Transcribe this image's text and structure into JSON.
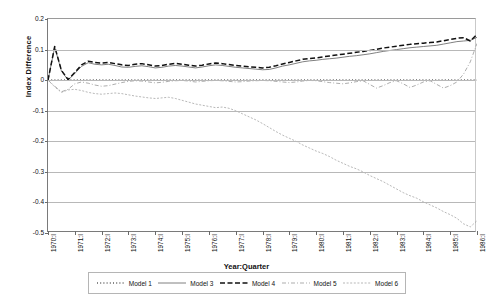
{
  "chart_data": {
    "type": "line",
    "title": "",
    "xlabel": "Year:Quarter",
    "ylabel": "Index Difference",
    "ylim": [
      -0.5,
      0.2
    ],
    "yticks": [
      0.2,
      0.1,
      0,
      -0.1,
      -0.2,
      -0.3,
      -0.4,
      -0.5
    ],
    "ytick_labels": [
      "0.2",
      "0.1",
      "0",
      "-0.1",
      "-0.2",
      "-0.3",
      "-0.4",
      "-0.5"
    ],
    "grid": true,
    "legend_position": "bottom",
    "categories": [
      "1970:I",
      "1970:II",
      "1970:III",
      "1970:IV",
      "1971:I",
      "1971:II",
      "1971:III",
      "1971:IV",
      "1972:I",
      "1972:II",
      "1972:III",
      "1972:IV",
      "1973:I",
      "1973:II",
      "1973:III",
      "1973:IV",
      "1974:I",
      "1974:II",
      "1974:III",
      "1974:IV",
      "1975:I",
      "1975:II",
      "1975:III",
      "1975:IV",
      "1976:I",
      "1976:II",
      "1976:III",
      "1976:IV",
      "1977:I",
      "1977:II",
      "1977:III",
      "1977:IV",
      "1978:I",
      "1978:II",
      "1978:III",
      "1978:IV",
      "1979:I",
      "1979:II",
      "1979:III",
      "1979:IV",
      "1980:I",
      "1980:II",
      "1980:III",
      "1980:IV",
      "1981:I",
      "1981:II",
      "1981:III",
      "1981:IV",
      "1982:I",
      "1982:II",
      "1982:III",
      "1982:IV",
      "1983:I",
      "1983:II",
      "1983:III",
      "1983:IV",
      "1984:I",
      "1984:II",
      "1984:III",
      "1984:IV",
      "1985:I",
      "1985:II",
      "1985:III",
      "1985:IV",
      "1986:I"
    ],
    "xtick_labels": [
      "1970:I",
      "1971:I",
      "1972:I",
      "1973:I",
      "1974:I",
      "1975:I",
      "1976:I",
      "1977:I",
      "1978:I",
      "1979:I",
      "1980:I",
      "1981:I",
      "1982:I",
      "1983:I",
      "1984:I",
      "1985:I",
      "1986:I"
    ],
    "series": [
      {
        "name": "Model 1",
        "style": "dotted",
        "color": "#111111",
        "values": [
          0.0,
          0.0,
          0.0,
          0.0,
          0.0,
          0.0,
          0.0,
          0.0,
          0.0,
          0.0,
          0.0,
          0.0,
          0.0,
          0.0,
          0.0,
          0.0,
          0.0,
          0.0,
          0.0,
          0.0,
          0.0,
          0.0,
          0.0,
          0.0,
          0.0,
          0.0,
          0.0,
          0.0,
          0.0,
          0.0,
          0.0,
          0.0,
          0.0,
          0.0,
          0.0,
          0.0,
          0.0,
          0.0,
          0.0,
          0.0,
          0.0,
          0.0,
          0.0,
          0.0,
          0.0,
          0.0,
          0.0,
          0.0,
          0.0,
          0.0,
          0.0,
          0.0,
          0.0,
          0.0,
          0.0,
          0.0,
          0.0,
          0.0,
          0.0,
          0.0,
          0.0,
          0.0,
          0.0,
          0.0,
          0.0
        ]
      },
      {
        "name": "Model 3",
        "style": "solid",
        "color": "#5f5f5f",
        "values": [
          0.0,
          0.108,
          0.03,
          0.0,
          0.022,
          0.045,
          0.057,
          0.052,
          0.05,
          0.052,
          0.048,
          0.043,
          0.042,
          0.045,
          0.047,
          0.044,
          0.04,
          0.042,
          0.046,
          0.048,
          0.046,
          0.043,
          0.04,
          0.043,
          0.047,
          0.05,
          0.048,
          0.045,
          0.042,
          0.04,
          0.038,
          0.036,
          0.034,
          0.035,
          0.04,
          0.046,
          0.05,
          0.055,
          0.06,
          0.063,
          0.065,
          0.068,
          0.07,
          0.072,
          0.075,
          0.078,
          0.08,
          0.083,
          0.086,
          0.09,
          0.094,
          0.097,
          0.1,
          0.103,
          0.106,
          0.108,
          0.11,
          0.112,
          0.114,
          0.118,
          0.122,
          0.126,
          0.128,
          0.13,
          0.14
        ]
      },
      {
        "name": "Model 4",
        "style": "dashed-bold",
        "color": "#111111",
        "values": [
          0.0,
          0.11,
          0.032,
          0.002,
          0.025,
          0.05,
          0.062,
          0.058,
          0.056,
          0.058,
          0.054,
          0.05,
          0.048,
          0.052,
          0.054,
          0.05,
          0.046,
          0.048,
          0.052,
          0.055,
          0.052,
          0.049,
          0.046,
          0.049,
          0.053,
          0.056,
          0.054,
          0.051,
          0.048,
          0.046,
          0.044,
          0.042,
          0.04,
          0.042,
          0.047,
          0.053,
          0.058,
          0.063,
          0.068,
          0.071,
          0.073,
          0.076,
          0.079,
          0.082,
          0.085,
          0.088,
          0.091,
          0.094,
          0.097,
          0.101,
          0.105,
          0.108,
          0.111,
          0.114,
          0.117,
          0.119,
          0.121,
          0.123,
          0.125,
          0.129,
          0.133,
          0.137,
          0.139,
          0.128,
          0.15
        ]
      },
      {
        "name": "Model 5",
        "style": "dash-dot",
        "color": "#8a8a8a",
        "values": [
          0.0,
          -0.02,
          -0.038,
          -0.03,
          -0.012,
          -0.006,
          -0.01,
          -0.016,
          -0.02,
          -0.018,
          -0.013,
          -0.008,
          -0.004,
          -0.002,
          -0.003,
          -0.006,
          -0.009,
          -0.007,
          -0.004,
          -0.002,
          -0.001,
          -0.003,
          -0.006,
          -0.004,
          -0.002,
          -0.001,
          -0.002,
          -0.004,
          -0.006,
          -0.005,
          -0.003,
          -0.002,
          -0.001,
          -0.002,
          -0.004,
          -0.006,
          -0.008,
          -0.006,
          -0.003,
          -0.001,
          -0.002,
          -0.005,
          -0.008,
          -0.01,
          -0.012,
          -0.009,
          -0.005,
          -0.002,
          -0.014,
          -0.026,
          -0.018,
          -0.008,
          -0.002,
          -0.012,
          -0.024,
          -0.016,
          -0.006,
          -0.002,
          -0.014,
          -0.026,
          -0.018,
          -0.006,
          0.02,
          0.06,
          0.12
        ]
      },
      {
        "name": "Model 6",
        "style": "fine-dotted",
        "color": "#9a9a9a",
        "values": [
          0.0,
          -0.022,
          -0.04,
          -0.032,
          -0.03,
          -0.034,
          -0.04,
          -0.044,
          -0.046,
          -0.044,
          -0.042,
          -0.044,
          -0.048,
          -0.052,
          -0.055,
          -0.058,
          -0.06,
          -0.058,
          -0.056,
          -0.06,
          -0.066,
          -0.072,
          -0.078,
          -0.082,
          -0.086,
          -0.09,
          -0.088,
          -0.092,
          -0.1,
          -0.11,
          -0.12,
          -0.13,
          -0.142,
          -0.155,
          -0.168,
          -0.18,
          -0.19,
          -0.2,
          -0.212,
          -0.222,
          -0.232,
          -0.24,
          -0.25,
          -0.262,
          -0.272,
          -0.282,
          -0.29,
          -0.3,
          -0.312,
          -0.322,
          -0.332,
          -0.344,
          -0.356,
          -0.368,
          -0.378,
          -0.386,
          -0.398,
          -0.408,
          -0.418,
          -0.43,
          -0.44,
          -0.452,
          -0.47,
          -0.48,
          -0.46
        ]
      }
    ]
  },
  "legend": {
    "items": [
      {
        "label": "Model 1",
        "style": "dotted"
      },
      {
        "label": "Model 3",
        "style": "solid"
      },
      {
        "label": "Model 4",
        "style": "dashed-bold"
      },
      {
        "label": "Model 5",
        "style": "dash-dot"
      },
      {
        "label": "Model 6",
        "style": "fine-dotted"
      }
    ]
  }
}
